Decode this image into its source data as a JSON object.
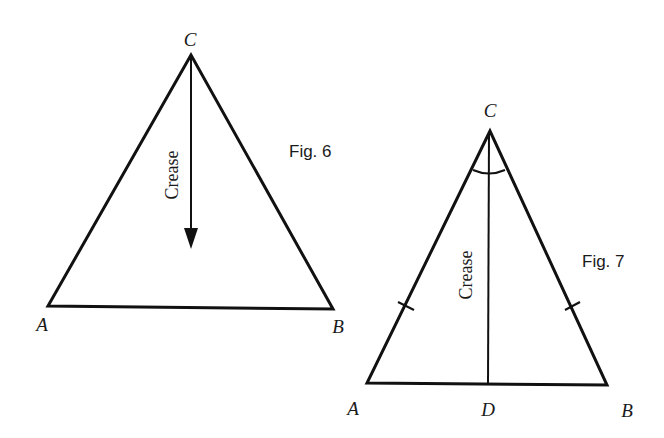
{
  "figures": [
    {
      "caption": "Fig. 6",
      "vertices": {
        "A": "A",
        "B": "B",
        "C": "C"
      },
      "crease_label": "Crease",
      "description": "Equilateral-looking triangle ABC with an arrow from C pointing down indicating the crease"
    },
    {
      "caption": "Fig. 7",
      "vertices": {
        "A": "A",
        "B": "B",
        "C": "C",
        "D": "D"
      },
      "crease_label": "Crease",
      "description": "Isosceles triangle ABC with crease CD from apex C to base midpoint D; equal sides marked with tick marks and angle at C marked with an arc"
    }
  ]
}
